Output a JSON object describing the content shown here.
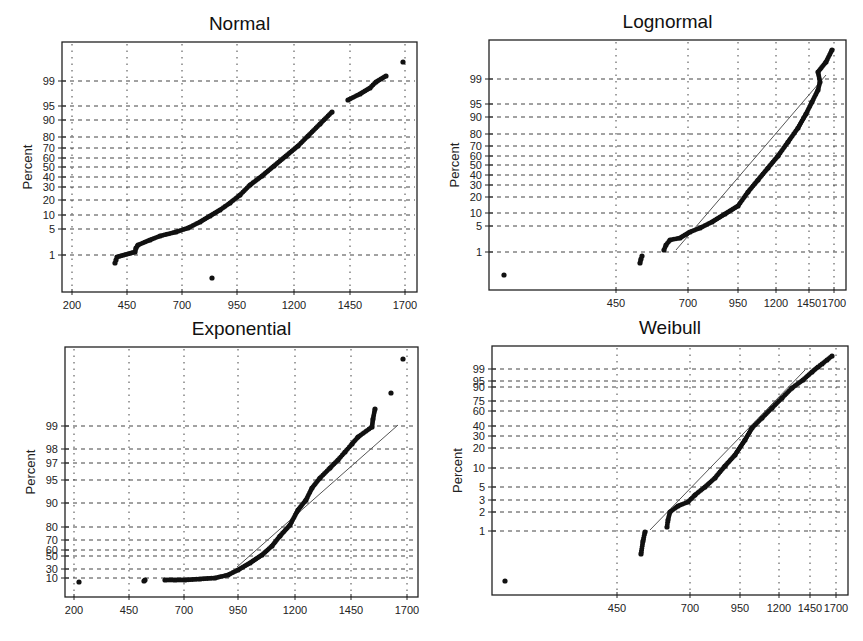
{
  "chart_data": [
    {
      "type": "scatter",
      "title": "Normal",
      "xlabel": "",
      "ylabel": "Percent",
      "x_ticks": [
        200,
        450,
        700,
        950,
        1200,
        1450,
        1700
      ],
      "y_ticks": [
        "1",
        "5",
        "10",
        "20",
        "30",
        "40",
        "50",
        "60",
        "70",
        "80",
        "90",
        "95",
        "99"
      ],
      "grid": true,
      "fit_line": false,
      "frame": {
        "left": 62,
        "top": 42,
        "right": 417,
        "bottom": 292
      },
      "x_pixels": [
        72,
        127,
        182,
        237,
        294,
        350,
        405
      ],
      "y_pixels": [
        255,
        229,
        215,
        200,
        187,
        177,
        167,
        158,
        148,
        137,
        120,
        106,
        81
      ],
      "points": [
        [
          212,
          278
        ],
        [
          115,
          263
        ],
        [
          116,
          260
        ],
        [
          117,
          257
        ],
        [
          135,
          252
        ],
        [
          136,
          248
        ],
        [
          138,
          245
        ],
        [
          150,
          240
        ],
        [
          160,
          236
        ],
        [
          176,
          232
        ],
        [
          188,
          228
        ],
        [
          200,
          222
        ],
        [
          210,
          216
        ],
        [
          220,
          210
        ],
        [
          230,
          203
        ],
        [
          240,
          195
        ],
        [
          250,
          185
        ],
        [
          262,
          176
        ],
        [
          274,
          166
        ],
        [
          286,
          156
        ],
        [
          298,
          146
        ],
        [
          308,
          136
        ],
        [
          320,
          124
        ],
        [
          332,
          112
        ],
        [
          348,
          100
        ],
        [
          360,
          94
        ],
        [
          370,
          88
        ],
        [
          376,
          82
        ],
        [
          386,
          76
        ],
        [
          403,
          62
        ]
      ]
    },
    {
      "type": "scatter",
      "title": "Lognormal",
      "xlabel": "",
      "ylabel": "Percent",
      "x_ticks": [
        450,
        700,
        950,
        1200,
        1450,
        1700
      ],
      "y_ticks": [
        "1",
        "5",
        "10",
        "20",
        "30",
        "40",
        "50",
        "60",
        "70",
        "80",
        "90",
        "95",
        "99"
      ],
      "grid": true,
      "fit_line": true,
      "fit_line_coords": [
        [
          676,
          250
        ],
        [
          826,
          75
        ]
      ],
      "frame": {
        "left": 489,
        "top": 40,
        "right": 846,
        "bottom": 290
      },
      "x_pixels": [
        616,
        688,
        738,
        776,
        809,
        834
      ],
      "y_pixels": [
        252,
        226,
        213,
        197,
        185,
        175,
        165,
        156,
        146,
        134,
        117,
        104,
        79
      ],
      "points": [
        [
          504,
          275
        ],
        [
          640,
          263
        ],
        [
          641,
          259
        ],
        [
          642,
          256
        ],
        [
          664,
          250
        ],
        [
          666,
          245
        ],
        [
          670,
          240
        ],
        [
          680,
          238
        ],
        [
          690,
          232
        ],
        [
          700,
          228
        ],
        [
          712,
          222
        ],
        [
          725,
          214
        ],
        [
          738,
          206
        ],
        [
          748,
          192
        ],
        [
          758,
          180
        ],
        [
          768,
          168
        ],
        [
          778,
          156
        ],
        [
          788,
          142
        ],
        [
          798,
          128
        ],
        [
          806,
          114
        ],
        [
          812,
          102
        ],
        [
          818,
          90
        ],
        [
          820,
          82
        ],
        [
          818,
          72
        ],
        [
          826,
          62
        ],
        [
          832,
          50
        ]
      ]
    },
    {
      "type": "scatter",
      "title": "Exponential",
      "xlabel": "",
      "ylabel": "Percent",
      "x_ticks": [
        200,
        450,
        700,
        950,
        1200,
        1450,
        1700
      ],
      "y_ticks": [
        "10",
        "30",
        "50",
        "60",
        "70",
        "80",
        "90",
        "95",
        "97",
        "98",
        "99"
      ],
      "grid": true,
      "fit_line": true,
      "fit_line_coords": [
        [
          237,
          567
        ],
        [
          398,
          425
        ]
      ],
      "frame": {
        "left": 65,
        "top": 347,
        "right": 418,
        "bottom": 597
      },
      "x_pixels": [
        74,
        129,
        184,
        238,
        295,
        351,
        407
      ],
      "y_pixels": [
        578,
        569,
        556,
        550,
        540,
        527,
        503,
        480,
        463,
        449,
        426
      ],
      "points": [
        [
          79,
          582
        ],
        [
          144,
          581
        ],
        [
          145,
          580
        ],
        [
          165,
          580
        ],
        [
          175,
          580
        ],
        [
          185,
          580
        ],
        [
          200,
          579
        ],
        [
          215,
          578
        ],
        [
          228,
          575
        ],
        [
          238,
          570
        ],
        [
          250,
          563
        ],
        [
          262,
          555
        ],
        [
          272,
          546
        ],
        [
          280,
          536
        ],
        [
          290,
          525
        ],
        [
          298,
          510
        ],
        [
          306,
          500
        ],
        [
          312,
          488
        ],
        [
          320,
          478
        ],
        [
          330,
          468
        ],
        [
          338,
          460
        ],
        [
          345,
          452
        ],
        [
          352,
          444
        ],
        [
          358,
          437
        ],
        [
          372,
          427
        ],
        [
          373,
          419
        ],
        [
          375,
          409
        ],
        [
          391,
          393
        ],
        [
          403,
          359
        ]
      ]
    },
    {
      "type": "scatter",
      "title": "Weibull",
      "xlabel": "",
      "ylabel": "Percent",
      "x_ticks": [
        450,
        700,
        950,
        1200,
        1450,
        1700
      ],
      "y_ticks": [
        "1",
        "2",
        "3",
        "5",
        "10",
        "20",
        "30",
        "40",
        "60",
        "75",
        "90",
        "95",
        "99"
      ],
      "grid": true,
      "fit_line": true,
      "fit_line_coords": [
        [
          650,
          530
        ],
        [
          805,
          370
        ]
      ],
      "frame": {
        "left": 492,
        "top": 346,
        "right": 848,
        "bottom": 595
      },
      "x_pixels": [
        617,
        690,
        740,
        779,
        810,
        836
      ],
      "y_pixels": [
        531,
        512,
        500,
        487,
        468,
        448,
        436,
        426,
        411,
        401,
        387,
        381,
        369
      ],
      "points": [
        [
          505,
          581
        ],
        [
          641,
          554
        ],
        [
          643,
          541
        ],
        [
          645,
          532
        ],
        [
          667,
          527
        ],
        [
          668,
          520
        ],
        [
          670,
          512
        ],
        [
          678,
          506
        ],
        [
          688,
          502
        ],
        [
          695,
          495
        ],
        [
          705,
          487
        ],
        [
          715,
          478
        ],
        [
          725,
          466
        ],
        [
          735,
          455
        ],
        [
          745,
          440
        ],
        [
          752,
          428
        ],
        [
          762,
          418
        ],
        [
          772,
          408
        ],
        [
          782,
          398
        ],
        [
          792,
          388
        ],
        [
          803,
          380
        ],
        [
          812,
          372
        ],
        [
          818,
          367
        ],
        [
          822,
          364
        ],
        [
          827,
          360
        ],
        [
          832,
          356
        ]
      ]
    }
  ]
}
